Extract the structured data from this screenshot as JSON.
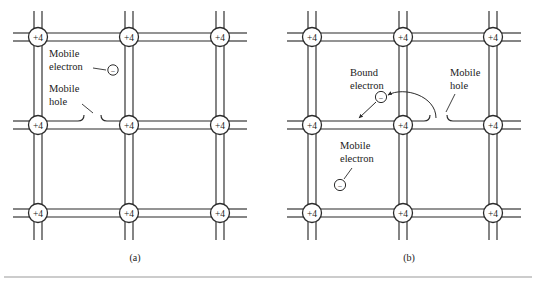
{
  "figure": {
    "background_color": "#ffffff",
    "line_color": "#2b2b2b",
    "rule_color": "#9a9a9a",
    "atom_label": "+4",
    "particle_symbol": "−"
  },
  "panels": [
    {
      "id": "a",
      "caption": "(a)",
      "atom_labels": [
        "+4",
        "+4",
        "+4",
        "+4",
        "+4",
        "+4",
        "+4",
        "+4",
        "+4"
      ],
      "annotations": [
        {
          "name": "mobile-electron",
          "line1": "Mobile",
          "line2": "electron"
        },
        {
          "name": "mobile-hole",
          "line1": "Mobile",
          "line2": "hole"
        }
      ],
      "particles": [
        {
          "name": "mobile-electron-particle",
          "symbol": "−"
        }
      ]
    },
    {
      "id": "b",
      "caption": "(b)",
      "atom_labels": [
        "+4",
        "+4",
        "+4",
        "+4",
        "+4",
        "+4",
        "+4",
        "+4",
        "+4"
      ],
      "annotations": [
        {
          "name": "bound-electron",
          "line1": "Bound",
          "line2": "electron"
        },
        {
          "name": "mobile-hole",
          "line1": "Mobile",
          "line2": "hole"
        },
        {
          "name": "mobile-electron",
          "line1": "Mobile",
          "line2": "electron"
        }
      ],
      "particles": [
        {
          "name": "bound-electron-particle",
          "symbol": "−"
        },
        {
          "name": "mobile-electron-particle",
          "symbol": "−"
        }
      ]
    }
  ]
}
